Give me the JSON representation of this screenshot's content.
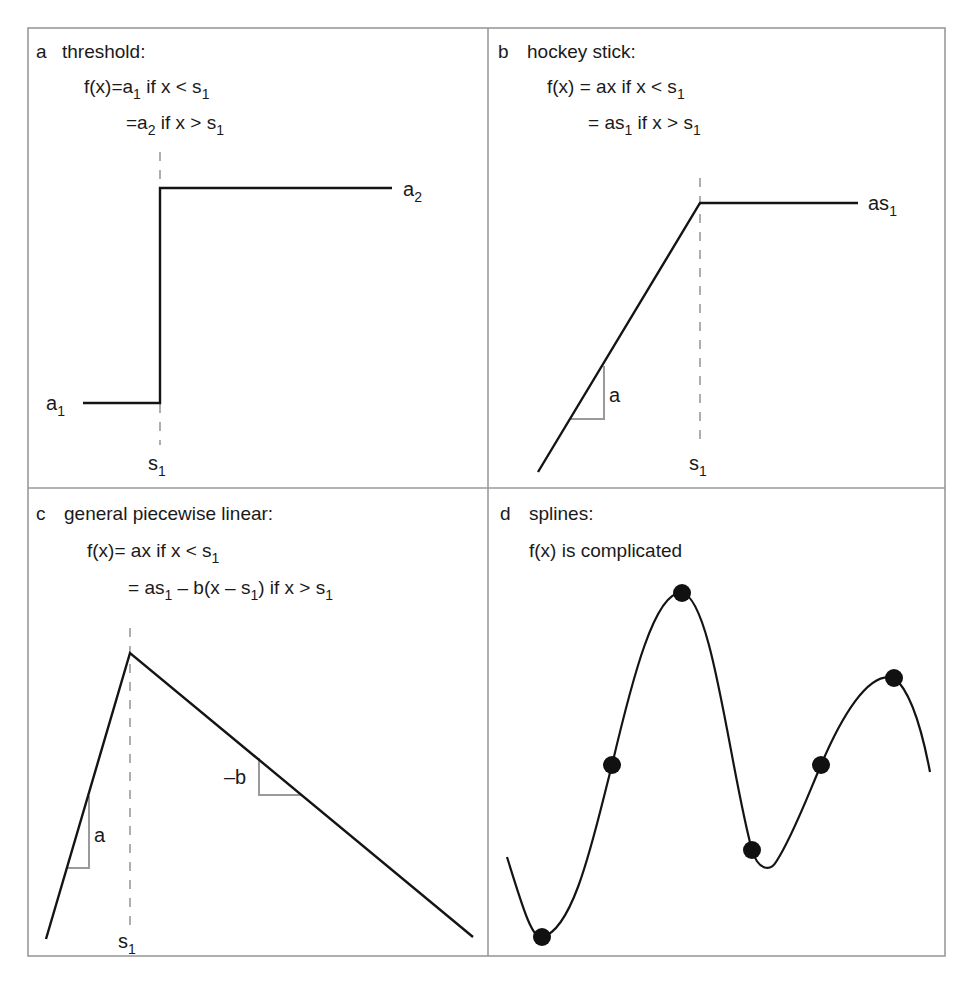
{
  "figure": {
    "width": 973,
    "height": 983,
    "frame": {
      "x": 28,
      "y": 28,
      "w": 917,
      "h": 928
    },
    "divider": {
      "x": 488,
      "y": 488
    },
    "colors": {
      "curve": "#141414",
      "guide": "#9a9a9a",
      "frame": "#9a9a9a",
      "text": "#1a1a1a"
    }
  },
  "panels": {
    "a": {
      "letter": "a",
      "title": "threshold:",
      "eq1": {
        "lhs": "f(x)=",
        "body": "a",
        "sub": "1",
        "rest": " if  x < s",
        "rsub": "1"
      },
      "eq2": {
        "lhs": "=",
        "body": "a",
        "sub": "2",
        "rest": " if  x > s",
        "rsub": "1"
      },
      "label_low": {
        "base": "a",
        "sub": "1"
      },
      "label_high": {
        "base": "a",
        "sub": "2"
      },
      "label_knot": {
        "base": "s",
        "sub": "1"
      },
      "path": "M 83 403 L 160 403 L 160 188 L 392 188",
      "guide": {
        "x": 160,
        "y1": 152,
        "y2": 445
      }
    },
    "b": {
      "letter": "b",
      "title": "hockey stick:",
      "eq1": {
        "lhs": "f(x) = ",
        "body": "ax if  x < s",
        "sub": "1"
      },
      "eq2": {
        "lhs": "= ",
        "body": "as",
        "sub": "1",
        "rest": " if  x > s",
        "rsub": "1"
      },
      "label_high": {
        "base": "as",
        "sub": "1"
      },
      "label_slope": "a",
      "label_knot": {
        "base": "s",
        "sub": "1"
      },
      "path": "M 538 472 L 700 203 L 858 203",
      "slope_path": "M 571 419 L 604 419 L 604 366",
      "guide": {
        "x": 700,
        "y1": 178,
        "y2": 448
      }
    },
    "c": {
      "letter": "c",
      "title": "general piecewise linear:",
      "eq1": {
        "lhs": "f(x)= ",
        "body": "ax if x < s",
        "sub": "1"
      },
      "eq2": {
        "lhs": "= ",
        "body": "as",
        "sub": "1",
        "mid": " – b(x – s",
        "msub": "1",
        "rest": ") if x > s",
        "rsub": "1"
      },
      "label_slope_a": "a",
      "label_slope_b": "–b",
      "label_knot": {
        "base": "s",
        "sub": "1"
      },
      "path": "M 46 939 L 130 653 L 473 937",
      "slope_a_path": "M 68 868 L 89 868 L 89 796",
      "slope_b_path": "M 259 758 L 259 795 L 301 795",
      "guide": {
        "x": 130,
        "y1": 628,
        "y2": 925
      }
    },
    "d": {
      "letter": "d",
      "title": "splines:",
      "eq1": "f(x) is complicated",
      "path": "M 507 857 C 522 905, 532 940, 542 937 C 575 930, 595 830, 612 765 C 632 680, 655 590, 682 593 C 712 597, 730 770, 752 850 C 758 870, 770 872, 776 862 C 792 838, 808 795, 821 765 C 840 720, 868 670, 894 678 C 910 690, 922 730, 930 772",
      "knots": [
        {
          "x": 542,
          "y": 937
        },
        {
          "x": 612,
          "y": 765
        },
        {
          "x": 682,
          "y": 593
        },
        {
          "x": 752,
          "y": 850
        },
        {
          "x": 821,
          "y": 765
        },
        {
          "x": 894,
          "y": 678
        }
      ]
    }
  },
  "chart_data": {
    "type": "line",
    "panels": [
      {
        "id": "a",
        "name": "threshold",
        "formula": [
          "f(x) = a1 if x < s1",
          "= a2 if x > s1"
        ],
        "annotations": [
          "a1",
          "a2",
          "s1"
        ]
      },
      {
        "id": "b",
        "name": "hockey stick",
        "formula": [
          "f(x) = ax if x < s1",
          "= as1 if x > s1"
        ],
        "annotations": [
          "a",
          "as1",
          "s1"
        ]
      },
      {
        "id": "c",
        "name": "general piecewise linear",
        "formula": [
          "f(x) = ax if x < s1",
          "= as1 - b(x - s1) if x > s1"
        ],
        "annotations": [
          "a",
          "-b",
          "s1"
        ]
      },
      {
        "id": "d",
        "name": "splines",
        "formula": [
          "f(x) is complicated"
        ],
        "knots": 6
      }
    ],
    "grid": false,
    "legend": null
  }
}
